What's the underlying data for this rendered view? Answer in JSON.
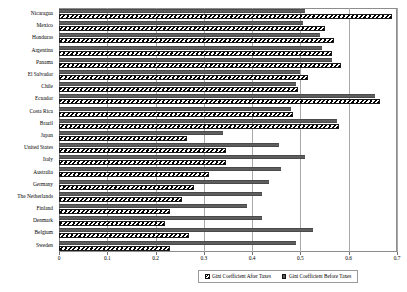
{
  "chart_data": {
    "type": "bar",
    "orientation": "horizontal",
    "title": "",
    "xlabel": "",
    "ylabel": "",
    "xlim": [
      0,
      0.7
    ],
    "xticks": [
      "0",
      "0.1",
      "0.2",
      "0.3",
      "0.4",
      "0.5",
      "0.6",
      "0.7"
    ],
    "xtick_values": [
      0,
      0.1,
      0.2,
      0.3,
      0.4,
      0.5,
      0.6,
      0.7
    ],
    "grid": true,
    "grid_axis": "x",
    "legend_position": "bottom-right",
    "categories": [
      "Nicaragua",
      "Mexico",
      "Honduras",
      "Argentina",
      "Panama",
      "El Salvador",
      "Chile",
      "Ecuador",
      "Costa Rica",
      "Brazil",
      "Japan",
      "United States",
      "Italy",
      "Australia",
      "Germany",
      "The Netherlands",
      "Finland",
      "Denmark",
      "Belgium",
      "Sweden"
    ],
    "series": [
      {
        "name": "Gini Coefficient After Taxes",
        "pattern": "diagonal-hatch",
        "color": "#000000",
        "values": [
          0.69,
          0.55,
          0.57,
          0.565,
          0.585,
          0.515,
          0.495,
          0.665,
          0.485,
          0.58,
          0.265,
          0.345,
          0.345,
          0.31,
          0.28,
          0.255,
          0.23,
          0.22,
          0.27,
          0.23
        ]
      },
      {
        "name": "Gini Coefficient Before Taxes",
        "pattern": "solid",
        "color": "#5e5e5e",
        "values": [
          0.51,
          0.505,
          0.54,
          0.545,
          0.565,
          0.5,
          0.49,
          0.655,
          0.48,
          0.575,
          0.34,
          0.455,
          0.51,
          0.46,
          0.435,
          0.42,
          0.39,
          0.42,
          0.525,
          0.49
        ]
      }
    ]
  },
  "legend": {
    "items": [
      {
        "label": "Gini Coefficient After Taxes",
        "swatch": "hatch-swatch-icon"
      },
      {
        "label": "Gini Coefficient Before Taxes",
        "swatch": "solid-swatch-icon"
      }
    ]
  }
}
